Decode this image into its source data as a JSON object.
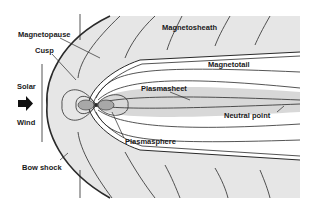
{
  "diagram": {
    "type": "magnetosphere-schematic",
    "colors": {
      "background": "#ffffff",
      "sheath_fill": "#e6e6e6",
      "plasma_fill": "#d4d4d4",
      "earth_lobe_fill": "#a8a8a8",
      "line": "#2a2a2a",
      "text": "#1a1a1a"
    },
    "labels": {
      "magnetosheath": "Magnetosheath",
      "magnetopause": "Magnetopause",
      "cusp": "Cusp",
      "magnetotail": "Magnetotail",
      "plasmasheet": "Plasmasheet",
      "solar": "Solar",
      "wind": "Wind",
      "neutral_point": "Neutral point",
      "plasmasphere": "Plasmasphere",
      "bow_shock": "Bow shock"
    },
    "icons": {
      "solar_wind_arrow": "right-arrow-icon"
    }
  }
}
